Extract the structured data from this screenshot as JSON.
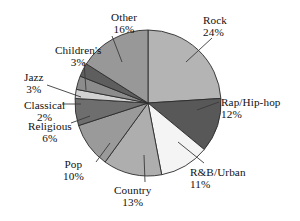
{
  "chart_data": {
    "type": "pie",
    "title": "",
    "subtitle": "",
    "xlabel": "",
    "ylabel": "",
    "legend_position": "none",
    "grid": false,
    "units": "percent",
    "categories": [
      "Rock",
      "Rap/Hip-hop",
      "R&B/Urban",
      "Country",
      "Pop",
      "Religious",
      "Classical",
      "Jazz",
      "Children's",
      "Other"
    ],
    "values": [
      24,
      12,
      11,
      13,
      10,
      6,
      2,
      3,
      3,
      16
    ],
    "slices": [
      {
        "label": "Rock",
        "percent_text": "24%",
        "value": 24,
        "color": "#b4b4b4",
        "start_angle": 0,
        "end_angle": 86.4,
        "label_align": "left",
        "label_x": 203,
        "label_y": 14,
        "leader": [
          212,
          38,
          186,
          62
        ]
      },
      {
        "label": "Rap/Hip-hop",
        "percent_text": "12%",
        "value": 12,
        "color": "#585858",
        "start_angle": 86.4,
        "end_angle": 129.6,
        "label_align": "left",
        "label_x": 221,
        "label_y": 96,
        "leader": [
          219,
          102,
          197,
          110
        ]
      },
      {
        "label": "R&B/Urban",
        "percent_text": "11%",
        "value": 11,
        "color": "#f4f4f4",
        "start_angle": 129.6,
        "end_angle": 169.2,
        "label_align": "left",
        "label_x": 190,
        "label_y": 166,
        "leader": [
          204,
          163,
          178,
          142
        ]
      },
      {
        "label": "Country",
        "percent_text": "13%",
        "value": 13,
        "color": "#aeaeae",
        "start_angle": 169.2,
        "end_angle": 216.0,
        "label_align": "center",
        "label_x": 114,
        "label_y": 184,
        "leader": [
          145,
          182,
          144,
          155
        ]
      },
      {
        "label": "Pop",
        "percent_text": "10%",
        "value": 10,
        "color": "#9a9a9a",
        "start_angle": 216.0,
        "end_angle": 252.0,
        "label_align": "center",
        "label_x": 63,
        "label_y": 158,
        "leader": [
          96,
          162,
          110,
          143
        ]
      },
      {
        "label": "Religious",
        "percent_text": "6%",
        "value": 6,
        "color": "#6e6e6e",
        "start_angle": 252.0,
        "end_angle": 273.6,
        "label_align": "center",
        "label_x": 28,
        "label_y": 120,
        "leader": [
          71,
          123,
          90,
          116
        ]
      },
      {
        "label": "Classical",
        "percent_text": "2%",
        "value": 2,
        "color": "#d2d2d2",
        "start_angle": 273.6,
        "end_angle": 280.8,
        "label_align": "center",
        "label_x": 24,
        "label_y": 99,
        "leader": [
          62,
          104,
          81,
          104
        ]
      },
      {
        "label": "Jazz",
        "percent_text": "3%",
        "value": 3,
        "color": "#8c8c8c",
        "start_angle": 280.8,
        "end_angle": 291.6,
        "label_align": "center",
        "label_x": 24,
        "label_y": 71,
        "leader": [
          47,
          85,
          81,
          97
        ]
      },
      {
        "label": "Children's",
        "percent_text": "3%",
        "value": 3,
        "color": "#5e5e5e",
        "start_angle": 291.6,
        "end_angle": 302.4,
        "label_align": "center",
        "label_x": 55,
        "label_y": 44,
        "leader": [
          84,
          62,
          86,
          90
        ]
      },
      {
        "label": "Other",
        "percent_text": "16%",
        "value": 16,
        "color": "#989898",
        "start_angle": 302.4,
        "end_angle": 360.0,
        "label_align": "center",
        "label_x": 111,
        "label_y": 11,
        "leader": [
          112,
          36,
          122,
          62
        ]
      }
    ],
    "geometry": {
      "cx": 148,
      "cy": 103,
      "r": 73
    }
  }
}
